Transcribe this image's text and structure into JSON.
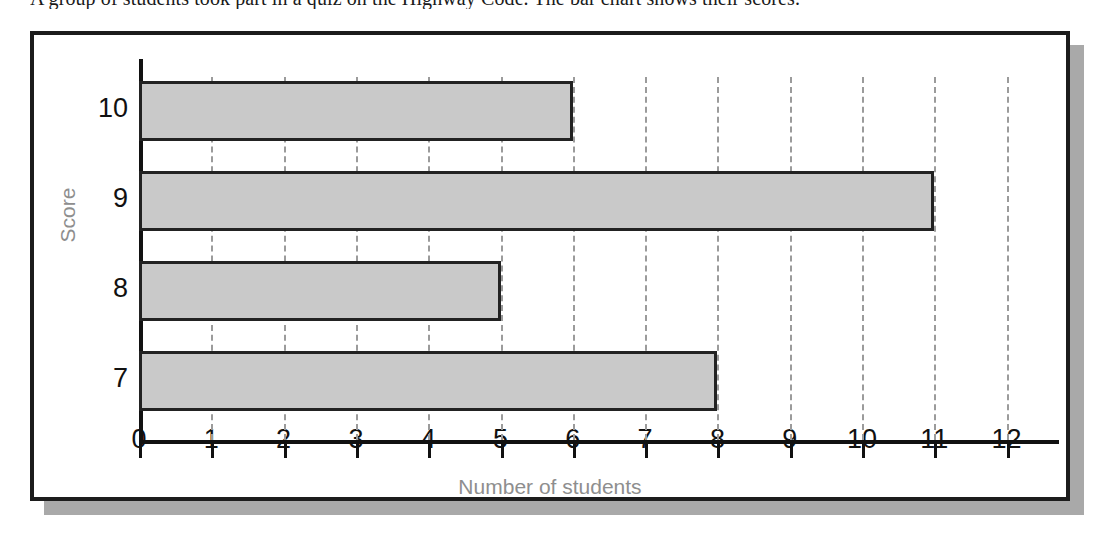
{
  "question": {
    "text": "A group of students took part in a quiz on the Highway Code. The bar chart shows their scores."
  },
  "colors": {
    "bar_fill": "#c9c9c9",
    "bar_border": "#222222",
    "axis": "#111111",
    "gridline": "#9b9b9b",
    "axis_title": "#8e8e8e",
    "frame": "#1c1c1c",
    "shadow": "#a9a9a9",
    "background": "#ffffff"
  },
  "chart_data": {
    "type": "bar",
    "orientation": "horizontal",
    "title": "",
    "xlabel": "Number of students",
    "ylabel": "Score",
    "categories": [
      "7",
      "8",
      "9",
      "10"
    ],
    "values": [
      8,
      5,
      11,
      6
    ],
    "series": [
      {
        "name": "Number of students",
        "values": [
          8,
          5,
          11,
          6
        ]
      }
    ],
    "x_ticks": [
      "0",
      "1",
      "2",
      "3",
      "4",
      "5",
      "6",
      "7",
      "8",
      "9",
      "10",
      "11",
      "12"
    ],
    "y_ticks": [
      "10",
      "9",
      "8",
      "7"
    ],
    "xlim": [
      0,
      12.8
    ],
    "grid": true,
    "grid_axis": "x",
    "grid_style": "dashed",
    "legend": false
  }
}
